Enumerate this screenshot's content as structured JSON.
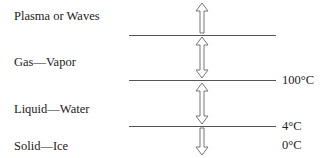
{
  "diagram": {
    "phases": [
      {
        "label": "Plasma or Waves"
      },
      {
        "label": "Gas—Vapor"
      },
      {
        "label": "Liquid—Water"
      },
      {
        "label": "Solid—Ice"
      }
    ],
    "boundaries": [
      {
        "temperature": ""
      },
      {
        "temperature": "100°C"
      },
      {
        "temperature": "4°C"
      }
    ],
    "extra_temperature": "0°C",
    "arrows": [
      {
        "type": "up-arrow",
        "between": "Gas—Vapor to Plasma or Waves"
      },
      {
        "type": "double-arrow",
        "between": "Gas—Vapor"
      },
      {
        "type": "double-arrow",
        "between": "Liquid—Water"
      },
      {
        "type": "down-arrow",
        "between": "Solid—Ice"
      }
    ],
    "colors": {
      "line": "#555555",
      "text": "#222222",
      "arrow": "#666666"
    }
  }
}
